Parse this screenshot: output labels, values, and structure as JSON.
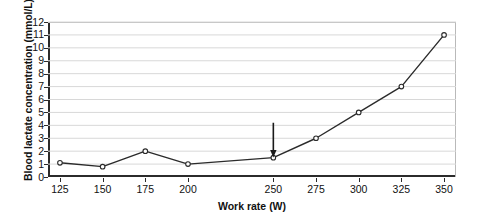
{
  "chart_data": {
    "type": "line",
    "title": "",
    "xlabel": "Work rate (W)",
    "ylabel": "Blood lactate concentration (mmol/L)",
    "x": [
      125,
      150,
      175,
      200,
      250,
      275,
      300,
      325,
      350
    ],
    "values": [
      1.1,
      0.8,
      2.0,
      1.0,
      1.5,
      3.0,
      5.0,
      7.0,
      11.0
    ],
    "series": [
      {
        "name": "Blood lactate",
        "values": [
          1.1,
          0.8,
          2.0,
          1.0,
          1.5,
          3.0,
          5.0,
          7.0,
          11.0
        ]
      }
    ],
    "xlim": [
      118,
      357
    ],
    "ylim": [
      0,
      12
    ],
    "xticks": [
      125,
      150,
      175,
      200,
      250,
      275,
      300,
      325,
      350
    ],
    "xtick_labels": [
      "125",
      "150",
      "175",
      "200",
      "250",
      "275",
      "300",
      "325",
      "350"
    ],
    "yticks": [
      0,
      1,
      2,
      3,
      4,
      5,
      6,
      7,
      8,
      9,
      10,
      11,
      12
    ],
    "ytick_labels": [
      "0",
      "1",
      "2",
      "3",
      "4",
      "5",
      "6",
      "7",
      "8",
      "9",
      "10",
      "11",
      "12"
    ],
    "grid": true,
    "grid_axis": "y",
    "legend": false,
    "legend_position": "none",
    "marker": "open-circle",
    "line_color": "#2b2b2b",
    "marker_fill": "#ffffff",
    "grid_color": "#d8d8d8",
    "axis_color": "#2b2b2b",
    "annotations": [
      {
        "type": "arrow",
        "name": "lactate-threshold-arrow",
        "direction": "down",
        "x": 250,
        "y_tip": 1.7,
        "y_tail": 4.2,
        "label": ""
      }
    ]
  }
}
